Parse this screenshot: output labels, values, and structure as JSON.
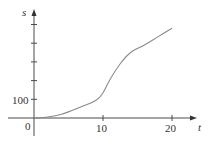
{
  "chart_data": {
    "type": "line",
    "title": "",
    "xlabel": "t",
    "ylabel": "s",
    "xlim": [
      -3.8,
      23.5
    ],
    "ylim": [
      -50,
      580
    ],
    "x_ticks": [
      10,
      20
    ],
    "x_tick_labels": [
      "10",
      "20"
    ],
    "y_ticks": [
      100,
      200,
      300,
      400,
      500
    ],
    "y_tick_labels": [
      "100",
      "",
      "",
      "",
      ""
    ],
    "origin_label": "0",
    "grid": false,
    "legend": null,
    "series": [
      {
        "name": "s(t)",
        "x": [
          0,
          2,
          4,
          6.5,
          9,
          10,
          11,
          12.5,
          14,
          16,
          18,
          20
        ],
        "y": [
          0,
          5,
          20,
          55,
          95,
          135,
          205,
          290,
          350,
          390,
          435,
          480
        ]
      }
    ]
  },
  "labels": {
    "y_axis": "s",
    "x_axis": "t",
    "origin": "0",
    "y_tick_100": "100",
    "x_tick_10": "10",
    "x_tick_20": "20"
  }
}
